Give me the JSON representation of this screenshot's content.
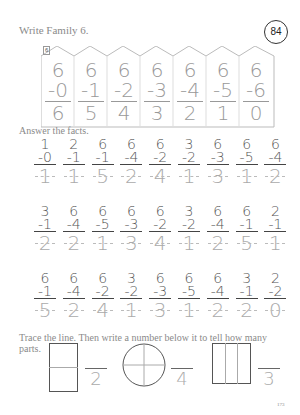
{
  "header": {
    "title": "Write Family 6.",
    "lesson_number": "84"
  },
  "family_house": {
    "tag": "6",
    "columns": [
      {
        "top": "6",
        "sub": "-0",
        "ans": "6"
      },
      {
        "top": "6",
        "sub": "-1",
        "ans": "5"
      },
      {
        "top": "6",
        "sub": "-2",
        "ans": "4"
      },
      {
        "top": "6",
        "sub": "-3",
        "ans": "3"
      },
      {
        "top": "6",
        "sub": "-4",
        "ans": "2"
      },
      {
        "top": "6",
        "sub": "-5",
        "ans": "1"
      },
      {
        "top": "6",
        "sub": "-6",
        "ans": "0"
      }
    ]
  },
  "answer_facts": {
    "title": "Answer the facts.",
    "rows": [
      [
        {
          "top": "1",
          "sub": "-0",
          "ans": "1"
        },
        {
          "top": "2",
          "sub": "-1",
          "ans": "1"
        },
        {
          "top": "6",
          "sub": "-1",
          "ans": "5"
        },
        {
          "top": "6",
          "sub": "-4",
          "ans": "2"
        },
        {
          "top": "6",
          "sub": "-2",
          "ans": "4"
        },
        {
          "top": "3",
          "sub": "-2",
          "ans": "1"
        },
        {
          "top": "6",
          "sub": "-3",
          "ans": "3"
        },
        {
          "top": "6",
          "sub": "-5",
          "ans": "1"
        },
        {
          "top": "6",
          "sub": "-4",
          "ans": "2"
        }
      ],
      [
        {
          "top": "3",
          "sub": "-1",
          "ans": "2"
        },
        {
          "top": "6",
          "sub": "-4",
          "ans": "2"
        },
        {
          "top": "6",
          "sub": "-5",
          "ans": "1"
        },
        {
          "top": "6",
          "sub": "-3",
          "ans": "3"
        },
        {
          "top": "6",
          "sub": "-2",
          "ans": "4"
        },
        {
          "top": "3",
          "sub": "-2",
          "ans": "1"
        },
        {
          "top": "6",
          "sub": "-4",
          "ans": "2"
        },
        {
          "top": "6",
          "sub": "-1",
          "ans": "5"
        },
        {
          "top": "2",
          "sub": "-1",
          "ans": "1"
        }
      ],
      [
        {
          "top": "6",
          "sub": "-1",
          "ans": "5"
        },
        {
          "top": "6",
          "sub": "-4",
          "ans": "2"
        },
        {
          "top": "6",
          "sub": "-2",
          "ans": "4"
        },
        {
          "top": "3",
          "sub": "-2",
          "ans": "1"
        },
        {
          "top": "6",
          "sub": "-3",
          "ans": "3"
        },
        {
          "top": "6",
          "sub": "-5",
          "ans": "1"
        },
        {
          "top": "6",
          "sub": "-4",
          "ans": "2"
        },
        {
          "top": "3",
          "sub": "-1",
          "ans": "2"
        },
        {
          "top": "2",
          "sub": "-2",
          "ans": "0"
        }
      ]
    ]
  },
  "trace": {
    "instruction": "Trace the line. Then write a number below it to tell how many parts.",
    "shapes": [
      {
        "shape": "rectangle-halves",
        "answer": "2"
      },
      {
        "shape": "circle-quarters",
        "answer": "4"
      },
      {
        "shape": "rectangle-thirds",
        "answer": "3"
      }
    ]
  },
  "footer": {
    "page_number": "173"
  }
}
